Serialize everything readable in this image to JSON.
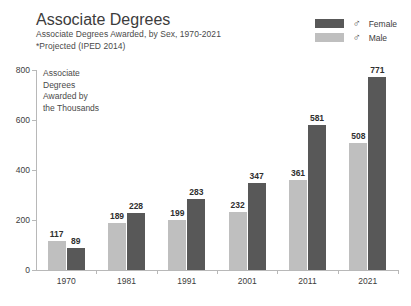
{
  "header": {
    "title": "Associate Degrees",
    "subtitle": "Associate Degrees Awarded, by Sex, 1970-2021",
    "note": "*Projected (IPED 2014)"
  },
  "legend": {
    "items": [
      {
        "label": "Female",
        "symbol": "♂",
        "color": "#585858"
      },
      {
        "label": "Male",
        "symbol": "♂",
        "color": "#bfbfbf"
      }
    ]
  },
  "annotation": {
    "line1": "Associate",
    "line2": "Degrees",
    "line3": "Awarded by",
    "line4": "the Thousands"
  },
  "axis": {
    "y_ticks": [
      "800",
      "600",
      "400",
      "200",
      "0"
    ]
  },
  "chart_data": {
    "type": "bar",
    "title": "Associate Degrees",
    "subtitle": "Associate Degrees Awarded, by Sex, 1970-2021",
    "note": "*Projected (IPED 2014)",
    "annotation": "Associate Degrees Awarded by the Thousands",
    "categories": [
      "1970",
      "1981",
      "1991",
      "2001",
      "2011",
      "2021"
    ],
    "series": [
      {
        "name": "Male",
        "color": "#bfbfbf",
        "values": [
          117,
          189,
          199,
          232,
          361,
          508
        ]
      },
      {
        "name": "Female",
        "color": "#585858",
        "values": [
          89,
          228,
          283,
          347,
          581,
          771
        ]
      }
    ],
    "xlabel": "",
    "ylabel": "",
    "ylim": [
      0,
      800
    ],
    "ytick_step": 200,
    "grid": false,
    "legend_position": "top-right"
  }
}
